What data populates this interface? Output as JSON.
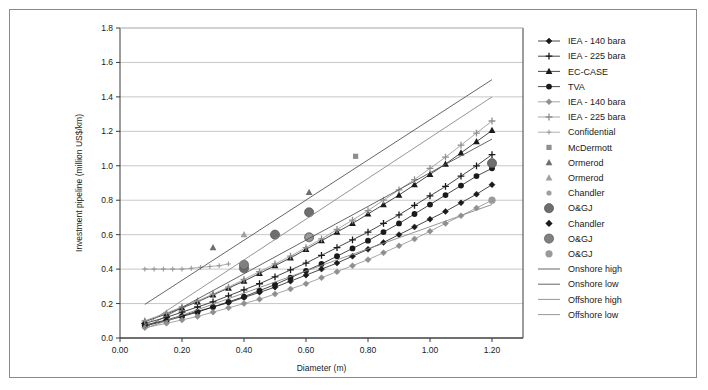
{
  "chart_data": {
    "type": "scatter",
    "title": "",
    "xlabel": "Diameter (m)",
    "ylabel": "Investment pipeline (million US$/km)",
    "xlim": [
      0.0,
      1.3
    ],
    "ylim": [
      0.0,
      1.8
    ],
    "xticks": [
      "0.00",
      "0.20",
      "0.40",
      "0.60",
      "0.80",
      "1.00",
      "1.20"
    ],
    "xtick_values": [
      0.0,
      0.2,
      0.4,
      0.6,
      0.8,
      1.0,
      1.2
    ],
    "yticks": [
      "0.0",
      "0.2",
      "0.4",
      "0.6",
      "0.8",
      "1.0",
      "1.2",
      "1.4",
      "1.6",
      "1.8"
    ],
    "ytick_values": [
      0.0,
      0.2,
      0.4,
      0.6,
      0.8,
      1.0,
      1.2,
      1.4,
      1.6,
      1.8
    ],
    "grid": "horizontal",
    "legend_position": "right",
    "series": [
      {
        "name": "IEA - 140 bara",
        "marker": "diamond",
        "color": "#1a1a1a",
        "line": true,
        "x": [
          0.08,
          0.15,
          0.2,
          0.25,
          0.3,
          0.35,
          0.4,
          0.45,
          0.5,
          0.55,
          0.6,
          0.65,
          0.7,
          0.75,
          0.8,
          0.85,
          0.9,
          0.95,
          1.0,
          1.05,
          1.1,
          1.15,
          1.2
        ],
        "values": [
          0.075,
          0.105,
          0.13,
          0.155,
          0.18,
          0.205,
          0.235,
          0.265,
          0.295,
          0.33,
          0.365,
          0.4,
          0.435,
          0.475,
          0.515,
          0.555,
          0.6,
          0.645,
          0.69,
          0.735,
          0.785,
          0.835,
          0.89
        ]
      },
      {
        "name": "IEA - 225 bara",
        "marker": "plus",
        "color": "#1a1a1a",
        "line": true,
        "x": [
          0.08,
          0.15,
          0.2,
          0.25,
          0.3,
          0.35,
          0.4,
          0.45,
          0.5,
          0.55,
          0.6,
          0.65,
          0.7,
          0.75,
          0.8,
          0.85,
          0.9,
          0.95,
          1.0,
          1.05,
          1.1,
          1.15,
          1.2
        ],
        "values": [
          0.085,
          0.12,
          0.15,
          0.18,
          0.21,
          0.245,
          0.28,
          0.315,
          0.355,
          0.395,
          0.435,
          0.48,
          0.525,
          0.57,
          0.615,
          0.665,
          0.715,
          0.77,
          0.825,
          0.88,
          0.94,
          1.0,
          1.065
        ]
      },
      {
        "name": "EC-CASE",
        "marker": "triangle",
        "color": "#1a1a1a",
        "line": true,
        "x": [
          0.08,
          0.15,
          0.2,
          0.25,
          0.3,
          0.35,
          0.4,
          0.45,
          0.5,
          0.55,
          0.6,
          0.65,
          0.7,
          0.75,
          0.8,
          0.85,
          0.9,
          0.95,
          1.0,
          1.05,
          1.1,
          1.15,
          1.2
        ],
        "values": [
          0.095,
          0.14,
          0.175,
          0.21,
          0.25,
          0.29,
          0.33,
          0.375,
          0.42,
          0.465,
          0.515,
          0.565,
          0.615,
          0.665,
          0.72,
          0.775,
          0.83,
          0.89,
          0.95,
          1.01,
          1.075,
          1.14,
          1.205
        ]
      },
      {
        "name": "TVA",
        "marker": "circle",
        "color": "#1a1a1a",
        "line": true,
        "x": [
          0.08,
          0.15,
          0.2,
          0.25,
          0.3,
          0.35,
          0.4,
          0.45,
          0.5,
          0.55,
          0.6,
          0.65,
          0.7,
          0.75,
          0.8,
          0.85,
          0.9,
          0.95,
          1.0,
          1.05,
          1.1,
          1.15,
          1.2
        ],
        "values": [
          0.07,
          0.1,
          0.125,
          0.15,
          0.18,
          0.21,
          0.24,
          0.275,
          0.31,
          0.35,
          0.39,
          0.43,
          0.475,
          0.52,
          0.565,
          0.615,
          0.665,
          0.72,
          0.775,
          0.83,
          0.885,
          0.94,
          0.985
        ]
      },
      {
        "name": "IEA - 140 bara",
        "marker": "diamond",
        "color": "#8f8f8f",
        "line": true,
        "x": [
          0.08,
          0.15,
          0.2,
          0.25,
          0.3,
          0.35,
          0.4,
          0.45,
          0.5,
          0.55,
          0.6,
          0.65,
          0.7,
          0.75,
          0.8,
          0.85,
          0.9,
          0.95,
          1.0,
          1.05,
          1.1,
          1.15,
          1.2
        ],
        "values": [
          0.06,
          0.085,
          0.105,
          0.125,
          0.15,
          0.175,
          0.2,
          0.225,
          0.255,
          0.285,
          0.315,
          0.35,
          0.385,
          0.42,
          0.455,
          0.495,
          0.535,
          0.575,
          0.62,
          0.665,
          0.71,
          0.755,
          0.8
        ]
      },
      {
        "name": "IEA - 225 bara",
        "marker": "plus",
        "color": "#8f8f8f",
        "line": true,
        "x": [
          0.08,
          0.15,
          0.2,
          0.25,
          0.3,
          0.35,
          0.4,
          0.45,
          0.5,
          0.55,
          0.6,
          0.65,
          0.7,
          0.75,
          0.8,
          0.85,
          0.9,
          0.95,
          1.0,
          1.05,
          1.1,
          1.15,
          1.2
        ],
        "values": [
          0.1,
          0.145,
          0.18,
          0.215,
          0.255,
          0.295,
          0.34,
          0.385,
          0.43,
          0.475,
          0.525,
          0.575,
          0.63,
          0.685,
          0.74,
          0.8,
          0.86,
          0.92,
          0.985,
          1.05,
          1.12,
          1.19,
          1.26
        ]
      },
      {
        "name": "Confidential",
        "marker": "plus-small",
        "color": "#9a9a9a",
        "line": true,
        "x": [
          0.08,
          0.11,
          0.14,
          0.17,
          0.2,
          0.23,
          0.26,
          0.29,
          0.32,
          0.35
        ],
        "values": [
          0.4,
          0.4,
          0.4,
          0.4,
          0.4,
          0.405,
          0.41,
          0.415,
          0.42,
          0.43
        ]
      },
      {
        "name": "McDermott",
        "marker": "square",
        "color": "#8f8f8f",
        "line": false,
        "x": [
          0.76
        ],
        "values": [
          1.055
        ]
      },
      {
        "name": "Ormerod",
        "marker": "triangle",
        "color": "#6e6e6e",
        "line": false,
        "x": [
          0.3,
          0.61
        ],
        "values": [
          0.525,
          0.845
        ]
      },
      {
        "name": "Ormerod",
        "marker": "triangle",
        "color": "#a0a0a0",
        "line": false,
        "x": [
          0.4,
          0.4
        ],
        "values": [
          0.6,
          0.425
        ]
      },
      {
        "name": "Chandler",
        "marker": "circle-small",
        "color": "#a0a0a0",
        "line": false,
        "x": [
          0.4,
          0.61
        ],
        "values": [
          0.425,
          0.58
        ]
      },
      {
        "name": "O&GJ",
        "marker": "circle-large",
        "color": "#6e6e6e",
        "line": false,
        "x": [
          0.4,
          0.5,
          0.61,
          1.2
        ],
        "values": [
          0.405,
          0.6,
          0.73,
          1.015
        ]
      },
      {
        "name": "Chandler",
        "marker": "diamond-filled",
        "color": "#1a1a1a",
        "line": false,
        "x": [
          0.4
        ],
        "values": [
          0.425
        ]
      },
      {
        "name": "O&GJ",
        "marker": "circle-large",
        "color": "#808080",
        "line": false,
        "x": [
          0.4,
          0.61
        ],
        "values": [
          0.425,
          0.585
        ]
      },
      {
        "name": "O&GJ",
        "marker": "circle-med",
        "color": "#9a9a9a",
        "line": false,
        "x": [
          0.61,
          1.2
        ],
        "values": [
          0.585,
          0.8
        ]
      },
      {
        "name": "Onshore high",
        "marker": "none",
        "color": "#555555",
        "line": true,
        "x": [
          0.08,
          1.2
        ],
        "values": [
          0.195,
          1.5
        ]
      },
      {
        "name": "Onshore low",
        "marker": "none",
        "color": "#555555",
        "line": true,
        "x": [
          0.08,
          1.2
        ],
        "values": [
          0.06,
          1.155
        ]
      },
      {
        "name": "Offshore high",
        "marker": "none",
        "color": "#8a8a8a",
        "line": true,
        "x": [
          0.08,
          1.2
        ],
        "values": [
          0.075,
          1.4
        ]
      },
      {
        "name": "Offshore low",
        "marker": "none",
        "color": "#8a8a8a",
        "line": true,
        "x": [
          0.08,
          1.2
        ],
        "values": [
          0.055,
          0.775
        ]
      }
    ],
    "legend": [
      {
        "label": "IEA - 140 bara",
        "marker": "diamond",
        "color": "#1a1a1a",
        "line": true
      },
      {
        "label": "IEA - 225 bara",
        "marker": "plus",
        "color": "#1a1a1a",
        "line": true
      },
      {
        "label": "EC-CASE",
        "marker": "triangle",
        "color": "#1a1a1a",
        "line": true
      },
      {
        "label": "TVA",
        "marker": "circle",
        "color": "#1a1a1a",
        "line": true
      },
      {
        "label": "IEA - 140 bara",
        "marker": "diamond",
        "color": "#8f8f8f",
        "line": true
      },
      {
        "label": "IEA - 225 bara",
        "marker": "plus",
        "color": "#8f8f8f",
        "line": true
      },
      {
        "label": "Confidential",
        "marker": "plus-small",
        "color": "#9a9a9a",
        "line": true
      },
      {
        "label": "McDermott",
        "marker": "square",
        "color": "#8f8f8f",
        "line": false
      },
      {
        "label": "Ormerod",
        "marker": "triangle",
        "color": "#6e6e6e",
        "line": false
      },
      {
        "label": "Ormerod",
        "marker": "triangle",
        "color": "#a0a0a0",
        "line": false
      },
      {
        "label": "Chandler",
        "marker": "circle-small",
        "color": "#a0a0a0",
        "line": false
      },
      {
        "label": "O&GJ",
        "marker": "circle-large",
        "color": "#6e6e6e",
        "line": false
      },
      {
        "label": "Chandler",
        "marker": "diamond-filled",
        "color": "#1a1a1a",
        "line": false
      },
      {
        "label": "O&GJ",
        "marker": "circle-large",
        "color": "#808080",
        "line": false
      },
      {
        "label": "O&GJ",
        "marker": "circle-med",
        "color": "#9a9a9a",
        "line": false
      },
      {
        "label": "Onshore high",
        "marker": "none",
        "color": "#555555",
        "line": true
      },
      {
        "label": "Onshore low",
        "marker": "none",
        "color": "#555555",
        "line": true
      },
      {
        "label": "Offshore high",
        "marker": "none",
        "color": "#8a8a8a",
        "line": true
      },
      {
        "label": "Offshore low",
        "marker": "none",
        "color": "#8a8a8a",
        "line": true
      }
    ]
  }
}
